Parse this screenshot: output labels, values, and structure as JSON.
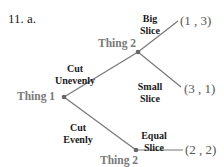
{
  "problem": {
    "label": "11. a."
  },
  "tree": {
    "nodes": [
      {
        "id": "thing1",
        "label": "Thing 1"
      },
      {
        "id": "thing2_top",
        "label": "Thing 2"
      },
      {
        "id": "thing2_bottom",
        "label": "Thing 2"
      }
    ],
    "edges": [
      {
        "from": "thing1",
        "to": "thing2_top",
        "line1": "Cut",
        "line2": "Unevenly"
      },
      {
        "from": "thing1",
        "to": "thing2_bottom",
        "line1": "Cut",
        "line2": "Evenly"
      },
      {
        "from": "thing2_top",
        "to": "payoff_1",
        "line1": "Big",
        "line2": "Slice"
      },
      {
        "from": "thing2_top",
        "to": "payoff_2",
        "line1": "Small",
        "line2": "Slice"
      },
      {
        "from": "thing2_bottom",
        "to": "payoff_3",
        "line1": "Equal",
        "line2": "Slice"
      }
    ],
    "payoffs": [
      {
        "id": "payoff_1",
        "label": "(1 , 3)"
      },
      {
        "id": "payoff_2",
        "label": "(3 , 1)"
      },
      {
        "id": "payoff_3",
        "label": "(2 , 2)"
      }
    ]
  },
  "colors": {
    "node_label": "#7a7a7a",
    "edge_label": "#1a1a1a",
    "line": "#777777",
    "payoff": "#555555"
  }
}
